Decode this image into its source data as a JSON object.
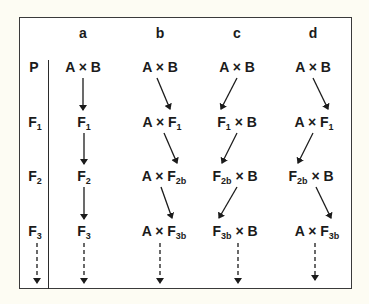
{
  "diagram": {
    "columns": [
      "a",
      "b",
      "c",
      "d"
    ],
    "rows": [
      {
        "label": "P",
        "sub": ""
      },
      {
        "label": "F",
        "sub": "1"
      },
      {
        "label": "F",
        "sub": "2"
      },
      {
        "label": "F",
        "sub": "3"
      }
    ],
    "cells": {
      "a": [
        {
          "l": "A × B",
          "s": "",
          "r": ""
        },
        {
          "l": "F",
          "s": "1",
          "r": ""
        },
        {
          "l": "F",
          "s": "2",
          "r": ""
        },
        {
          "l": "F",
          "s": "3",
          "r": ""
        }
      ],
      "b": [
        {
          "l": "A × B",
          "s": "",
          "r": ""
        },
        {
          "l": "A × F",
          "s": "1",
          "r": ""
        },
        {
          "l": "A × F",
          "s": "2b",
          "r": ""
        },
        {
          "l": "A × F",
          "s": "3b",
          "r": ""
        }
      ],
      "c": [
        {
          "l": "A × B",
          "s": "",
          "r": ""
        },
        {
          "l": "F",
          "s": "1",
          "r": " × B"
        },
        {
          "l": "F",
          "s": "2b",
          "r": " × B"
        },
        {
          "l": "F",
          "s": "3b",
          "r": " × B"
        }
      ],
      "d": [
        {
          "l": "A × B",
          "s": "",
          "r": ""
        },
        {
          "l": "A × F",
          "s": "1",
          "r": ""
        },
        {
          "l": "F",
          "s": "2b",
          "r": " × B"
        },
        {
          "l": "A × F",
          "s": "3b",
          "r": ""
        }
      ]
    },
    "arrow_style": {
      "solid": "generation transition",
      "dashed": "continuation"
    },
    "colors": {
      "ink": "#1b1b1b",
      "paper": "#fdfcf3",
      "frame": "#3a3a3a"
    }
  }
}
